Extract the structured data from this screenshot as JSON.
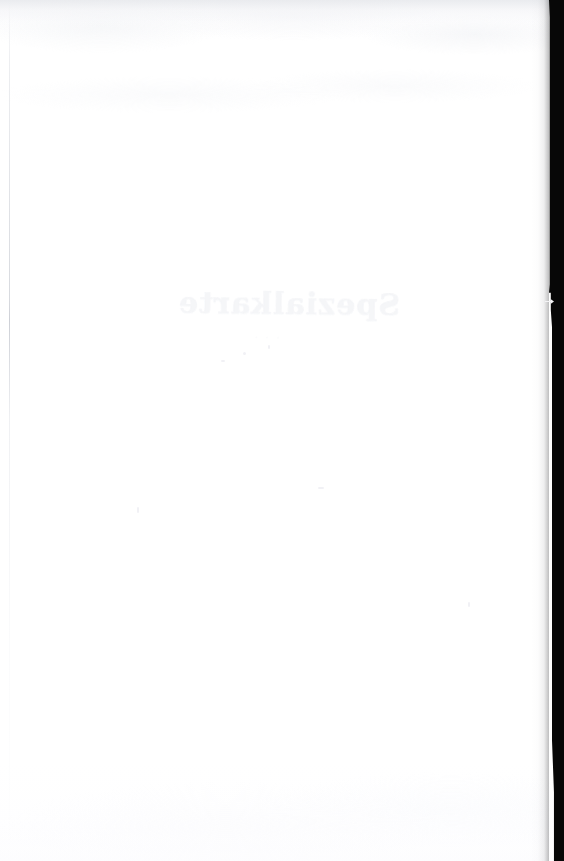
{
  "page": {
    "kind": "scanned-blank-page",
    "width": 564,
    "height": 861,
    "paper_color": "#ffffff",
    "gutter_color": "#070707",
    "bleed_ink_color": "#f4f5f8"
  },
  "bleed_through": {
    "note": "Faint mirror-reversed show-through from the printed side of the leaf",
    "title_text": "Spezialkarte",
    "subtitle_text": "· · ·"
  },
  "artifacts": {
    "top_edge_label": "scan-edge-haze",
    "left_rule_label": "binding-edge-line",
    "gutter_label": "scanner-gutter-shadow",
    "notch_label": "gutter-notch",
    "bottom_edge_label": "bottom-edge-haze"
  }
}
